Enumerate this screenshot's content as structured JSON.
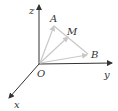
{
  "diagram": {
    "title": "",
    "origin_label": "O",
    "axes": [
      {
        "name": "x",
        "label": "x"
      },
      {
        "name": "y",
        "label": "y"
      },
      {
        "name": "z",
        "label": "z"
      }
    ],
    "points": [
      {
        "name": "A",
        "label": "A"
      },
      {
        "name": "M",
        "label": "M"
      },
      {
        "name": "B",
        "label": "B"
      }
    ],
    "vectors": [
      "OA",
      "OM",
      "OB"
    ],
    "segments": [
      "AB"
    ],
    "colors": {
      "axis": "#333333",
      "vector": "#c8c8c8",
      "label": "#333333"
    }
  }
}
